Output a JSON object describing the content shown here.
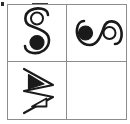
{
  "puzzle": {
    "type": "visual-analogy-matrix",
    "grid": {
      "rows": 2,
      "columns": 2
    },
    "border_color": "#8d8d8d",
    "ink_color": "#1a1a1a",
    "background_color": "#ffffff",
    "answer_cell": "row2-col2",
    "artifacts": [
      {
        "name": "corner-speck",
        "label": ""
      },
      {
        "name": "top-streak",
        "label": ""
      }
    ]
  },
  "cells": [
    {
      "id": "row1-col1",
      "position": "top-left",
      "figure_name": "s-curve-open-circle-top-filled-circle-bottom",
      "description": "Vertical S shaped double curve; small open circle inside the upper loop, larger filled black circle inside the lower loop",
      "orientation_degrees": 0,
      "elements": [
        {
          "shape": "s-curve",
          "fill": "none",
          "stroke": "#1a1a1a"
        },
        {
          "shape": "circle",
          "fill": "none",
          "stroke": "#1a1a1a",
          "location": "upper-loop",
          "size": "small"
        },
        {
          "shape": "circle",
          "fill": "#1a1a1a",
          "stroke": "#1a1a1a",
          "location": "lower-loop",
          "size": "large"
        }
      ],
      "empty": false
    },
    {
      "id": "row1-col2",
      "position": "top-right",
      "figure_name": "s-curve-rotated-filled-circle-left-open-circle-right",
      "description": "Same S shaped double curve rotated ninety degrees; filled black circle inside the left loop, open circle inside the right loop",
      "orientation_degrees": 90,
      "elements": [
        {
          "shape": "s-curve",
          "fill": "none",
          "stroke": "#1a1a1a"
        },
        {
          "shape": "circle",
          "fill": "#1a1a1a",
          "stroke": "#1a1a1a",
          "location": "left-loop",
          "size": "large"
        },
        {
          "shape": "circle",
          "fill": "none",
          "stroke": "#1a1a1a",
          "location": "right-loop",
          "size": "small"
        }
      ],
      "empty": false
    },
    {
      "id": "row2-col1",
      "position": "bottom-left",
      "figure_name": "chevron-zigzag-filled-triangle-top-open-triangle-bottom",
      "description": "Large outlined chevron zigzag pointing right; filled black triangle in the upper part, outlined triangle in the lower part",
      "orientation_degrees": 0,
      "elements": [
        {
          "shape": "chevron-zigzag",
          "fill": "none",
          "stroke": "#1a1a1a"
        },
        {
          "shape": "triangle",
          "fill": "#1a1a1a",
          "stroke": "#1a1a1a",
          "location": "upper",
          "size": "large"
        },
        {
          "shape": "triangle",
          "fill": "none",
          "stroke": "#1a1a1a",
          "location": "lower",
          "size": "small"
        }
      ],
      "empty": false
    },
    {
      "id": "row2-col2",
      "position": "bottom-right",
      "figure_name": "empty-answer-cell",
      "description": "Blank cell reserved for the answer",
      "orientation_degrees": 0,
      "elements": [],
      "empty": true
    }
  ]
}
